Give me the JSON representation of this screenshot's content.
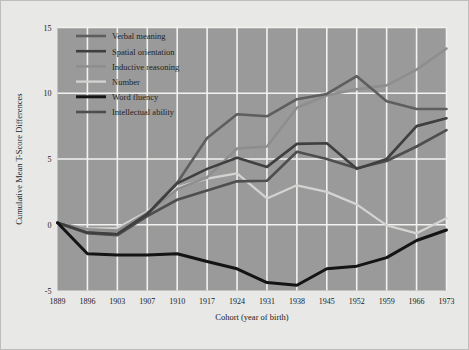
{
  "chart_data": {
    "type": "line",
    "title": "",
    "xlabel": "Cohort (year of birth)",
    "ylabel": "Cumulative Mean T-Score Differences",
    "categories": [
      "1889",
      "1896",
      "1903",
      "1907",
      "1910",
      "1917",
      "1924",
      "1931",
      "1938",
      "1945",
      "1952",
      "1959",
      "1966",
      "1973"
    ],
    "xtick_labels": [
      "1889",
      "1896",
      "1903",
      "1907",
      "1910",
      "1917",
      "1924",
      "1931",
      "1938",
      "1945",
      "1952",
      "1959",
      "1966",
      "1973"
    ],
    "ytick_labels": [
      "15",
      "10",
      "5",
      "0",
      "-5"
    ],
    "ytick_values": [
      15,
      10,
      5,
      0,
      -5
    ],
    "ylim": [
      -5,
      15
    ],
    "grid": true,
    "legend_position": "top-left",
    "plot_background": "#9a9a9a",
    "grid_color": "#f2f2f0",
    "figure_background": "#e8e8e6",
    "series": [
      {
        "name": "Verbal meaning",
        "color": "#5e5e5e",
        "width": 2.6,
        "values": [
          0.15,
          -0.6,
          -0.75,
          0.85,
          3.2,
          6.6,
          8.4,
          8.25,
          9.55,
          9.95,
          11.3,
          9.4,
          8.8,
          8.8
        ]
      },
      {
        "name": "Spatial orientation",
        "color": "#3f3f3f",
        "width": 2.6,
        "values": [
          0.15,
          -0.6,
          -0.7,
          0.8,
          3.15,
          4.25,
          5.1,
          4.4,
          6.15,
          6.2,
          4.25,
          5.0,
          7.5,
          8.1
        ]
      },
      {
        "name": "Inductive reasoning",
        "color": "#8e8e8e",
        "width": 2.6,
        "values": [
          0.15,
          -0.35,
          -0.45,
          0.9,
          2.7,
          3.6,
          5.8,
          5.95,
          8.9,
          9.85,
          10.3,
          10.6,
          11.8,
          13.4
        ]
      },
      {
        "name": "Number",
        "color": "#d3d3d1",
        "width": 2.3,
        "values": [
          0.15,
          -0.3,
          -0.25,
          1.0,
          2.85,
          3.5,
          3.9,
          2.0,
          3.0,
          2.5,
          1.55,
          -0.05,
          -0.65,
          0.5
        ]
      },
      {
        "name": "Word fluency",
        "color": "#141414",
        "width": 3.0,
        "values": [
          0.15,
          -2.2,
          -2.3,
          -2.3,
          -2.2,
          -2.8,
          -3.35,
          -4.4,
          -4.6,
          -3.35,
          -3.15,
          -2.5,
          -1.2,
          -0.4
        ]
      },
      {
        "name": "Intellectual ability",
        "color": "#4e4e4e",
        "width": 2.6,
        "values": [
          0.15,
          -0.65,
          -0.8,
          0.65,
          1.9,
          2.6,
          3.3,
          3.35,
          5.55,
          5.0,
          4.3,
          4.85,
          5.95,
          7.2
        ]
      }
    ]
  },
  "legend": {
    "items": [
      {
        "label": "Verbal meaning",
        "color": "#5e5e5e"
      },
      {
        "label": "Spatial orientation",
        "color": "#3f3f3f"
      },
      {
        "label": "Inductive reasoning",
        "color": "#8e8e8e"
      },
      {
        "label": "Number",
        "color": "#d3d3d1"
      },
      {
        "label": "Word fluency",
        "color": "#141414"
      },
      {
        "label": "Intellectual ability",
        "color": "#4e4e4e"
      }
    ]
  }
}
